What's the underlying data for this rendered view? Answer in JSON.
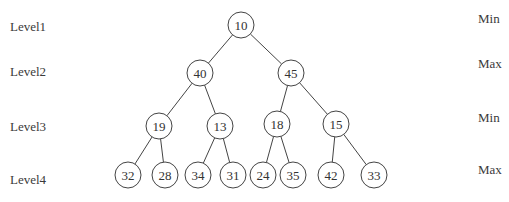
{
  "diagram": {
    "type": "min-max-heap",
    "levels": [
      {
        "label": "Level1",
        "kind": "Min",
        "y": 28,
        "label_top": 19,
        "kind_top": 11
      },
      {
        "label": "Level2",
        "kind": "Max",
        "y": 73,
        "label_top": 64,
        "kind_top": 56
      },
      {
        "label": "Level3",
        "kind": "Min",
        "y": 126,
        "label_top": 119,
        "kind_top": 110
      },
      {
        "label": "Level4",
        "kind": "Max",
        "y": 176,
        "label_top": 172,
        "kind_top": 162
      }
    ],
    "nodes": [
      {
        "id": "n0",
        "value": "10",
        "x": 241,
        "y": 25
      },
      {
        "id": "n1",
        "value": "40",
        "x": 200,
        "y": 73
      },
      {
        "id": "n2",
        "value": "45",
        "x": 291,
        "y": 73
      },
      {
        "id": "n3",
        "value": "19",
        "x": 159,
        "y": 126
      },
      {
        "id": "n4",
        "value": "13",
        "x": 220,
        "y": 126
      },
      {
        "id": "n5",
        "value": "18",
        "x": 277,
        "y": 124
      },
      {
        "id": "n6",
        "value": "15",
        "x": 336,
        "y": 124
      },
      {
        "id": "n7",
        "value": "32",
        "x": 128,
        "y": 175
      },
      {
        "id": "n8",
        "value": "28",
        "x": 165,
        "y": 175
      },
      {
        "id": "n9",
        "value": "34",
        "x": 198,
        "y": 175
      },
      {
        "id": "n10",
        "value": "31",
        "x": 233,
        "y": 175
      },
      {
        "id": "n11",
        "value": "24",
        "x": 263,
        "y": 175
      },
      {
        "id": "n12",
        "value": "35",
        "x": 293,
        "y": 175
      },
      {
        "id": "n13",
        "value": "42",
        "x": 331,
        "y": 175
      },
      {
        "id": "n14",
        "value": "33",
        "x": 374,
        "y": 175
      }
    ],
    "edges": [
      [
        "n0",
        "n1"
      ],
      [
        "n0",
        "n2"
      ],
      [
        "n1",
        "n3"
      ],
      [
        "n1",
        "n4"
      ],
      [
        "n2",
        "n5"
      ],
      [
        "n2",
        "n6"
      ],
      [
        "n3",
        "n7"
      ],
      [
        "n3",
        "n8"
      ],
      [
        "n4",
        "n9"
      ],
      [
        "n4",
        "n10"
      ],
      [
        "n5",
        "n11"
      ],
      [
        "n5",
        "n12"
      ],
      [
        "n6",
        "n13"
      ],
      [
        "n6",
        "n14"
      ]
    ],
    "node_radius": 13,
    "colors": {
      "stroke": "#444444",
      "text": "#333333",
      "background": "#ffffff"
    }
  }
}
